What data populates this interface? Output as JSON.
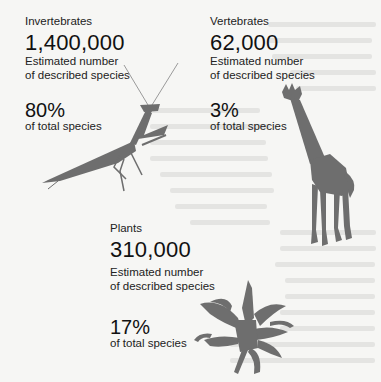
{
  "groups": [
    {
      "category": "Invertebrates",
      "count": "1,400,000",
      "description_line1": "Estimated number",
      "description_line2": "of described species",
      "percent": "80%",
      "percent_label": "of total species",
      "icon": "mantis-silhouette"
    },
    {
      "category": "Vertebrates",
      "count": "62,000",
      "description_line1": "Estimated number",
      "description_line2": "of described species",
      "percent": "3%",
      "percent_label": "of total species",
      "icon": "giraffe-silhouette"
    },
    {
      "category": "Plants",
      "count": "310,000",
      "description_line1": "Estimated number",
      "description_line2": "of described species",
      "percent": "17%",
      "percent_label": "of total species",
      "icon": "plant-silhouette"
    }
  ],
  "colors": {
    "background": "#f6f6f4",
    "silhouette": "#6e6e6e",
    "text": "#1c1c1c"
  }
}
